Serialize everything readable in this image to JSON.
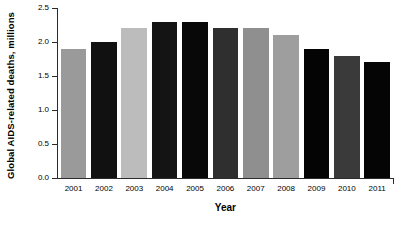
{
  "chart_data": {
    "type": "bar",
    "title": "",
    "xlabel": "Year",
    "ylabel": "Global AIDS-related deaths, millions",
    "categories": [
      "2001",
      "2002",
      "2003",
      "2004",
      "2005",
      "2006",
      "2007",
      "2008",
      "2009",
      "2010",
      "2011"
    ],
    "values": [
      1.9,
      2.0,
      2.2,
      2.3,
      2.3,
      2.2,
      2.2,
      2.1,
      1.9,
      1.8,
      1.7
    ],
    "bar_colors": [
      "#9a9a9a",
      "#111111",
      "#bcbcbc",
      "#141414",
      "#080808",
      "#2f2f2f",
      "#8f8f8f",
      "#9e9e9e",
      "#040404",
      "#3a3a3a",
      "#050505"
    ],
    "ylim": [
      0.0,
      2.5
    ],
    "ytick_values": [
      0.0,
      0.5,
      1.0,
      1.5,
      2.0,
      2.5
    ],
    "ytick_labels": [
      "0.0",
      "0.5",
      "1.0",
      "1.5",
      "2.0",
      "2.5"
    ],
    "grid": false,
    "legend": "none",
    "axis_color": "#2b2b2b",
    "background": "#ffffff"
  }
}
